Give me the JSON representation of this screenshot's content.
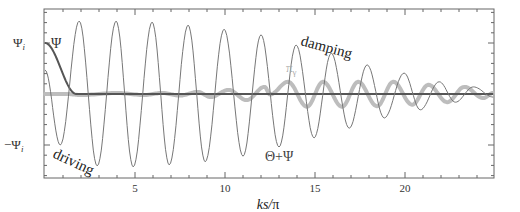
{
  "chart_data": {
    "type": "line",
    "title": "",
    "xlabel": "ks/π",
    "ylabel": "",
    "xlim": [
      0,
      24.9
    ],
    "ylim": [
      -1.65,
      1.65
    ],
    "y_unit": "Ψ_i",
    "x_ticks": [
      5,
      10,
      15,
      20
    ],
    "x_tick_labels": [
      "5",
      "10",
      "15",
      "20"
    ],
    "y_ticks": [
      1,
      -1
    ],
    "y_tick_labels": [
      "Ψ_i",
      "−Ψ_i"
    ],
    "grid": false,
    "legend": "none (inline annotations)",
    "series": [
      {
        "name": "Θ+Ψ",
        "style": "thin",
        "color": "#777777",
        "extrema": [
          [
            0,
            0.47
          ],
          [
            0.85,
            -1.0
          ],
          [
            1.9,
            1.43
          ],
          [
            2.9,
            -1.41
          ],
          [
            3.95,
            1.43
          ],
          [
            4.9,
            -1.43
          ],
          [
            5.95,
            1.41
          ],
          [
            6.9,
            -1.39
          ],
          [
            7.95,
            1.35
          ],
          [
            8.9,
            -1.33
          ],
          [
            9.95,
            1.27
          ],
          [
            11.0,
            -1.22
          ],
          [
            12.0,
            1.16
          ],
          [
            13.0,
            -1.04
          ],
          [
            13.95,
            0.96
          ],
          [
            14.95,
            -0.86
          ],
          [
            15.9,
            0.8
          ],
          [
            16.9,
            -0.67
          ],
          [
            17.9,
            0.57
          ],
          [
            18.85,
            -0.47
          ],
          [
            19.95,
            0.41
          ],
          [
            20.85,
            -0.31
          ],
          [
            21.9,
            0.24
          ],
          [
            22.8,
            -0.16
          ],
          [
            23.8,
            0.14
          ],
          [
            24.9,
            -0.06
          ]
        ]
      },
      {
        "name": "π_γ",
        "style": "thick",
        "color": "#bdbdbd",
        "extrema": [
          [
            0,
            0.0
          ],
          [
            1.2,
            0.0
          ],
          [
            2.0,
            -0.02
          ],
          [
            4.0,
            0.02
          ],
          [
            5.5,
            -0.02
          ],
          [
            6.5,
            0.02
          ],
          [
            7.5,
            -0.03
          ],
          [
            8.5,
            0.04
          ],
          [
            9.2,
            -0.06
          ],
          [
            10.2,
            0.08
          ],
          [
            11.2,
            -0.12
          ],
          [
            12.2,
            0.14
          ],
          [
            12.5,
            -0.01
          ],
          [
            13.5,
            0.24
          ],
          [
            14.55,
            -0.25
          ],
          [
            15.45,
            0.24
          ],
          [
            16.5,
            -0.25
          ],
          [
            17.4,
            0.24
          ],
          [
            18.45,
            -0.24
          ],
          [
            19.35,
            0.24
          ],
          [
            20.4,
            -0.21
          ],
          [
            21.3,
            0.18
          ],
          [
            22.35,
            -0.16
          ],
          [
            23.3,
            0.14
          ],
          [
            24.35,
            -0.08
          ],
          [
            24.9,
            0.02
          ]
        ]
      },
      {
        "name": "Ψ",
        "style": "medium",
        "color": "#555555",
        "points": [
          [
            0,
            1.0
          ],
          [
            0.3,
            0.95
          ],
          [
            0.6,
            0.75
          ],
          [
            0.9,
            0.45
          ],
          [
            1.2,
            0.2
          ],
          [
            1.5,
            0.05
          ],
          [
            1.8,
            0.0
          ],
          [
            24.9,
            0.0
          ]
        ]
      }
    ],
    "annotations": [
      {
        "text": "Ψ",
        "x": 0.45,
        "y": 1.0,
        "color": "#333333"
      },
      {
        "text": "driving",
        "x": 0.3,
        "y": -1.05,
        "rotate": 25,
        "color": "#222222"
      },
      {
        "text": "damping",
        "x": 14.2,
        "y": 1.0,
        "rotate": 15,
        "color": "#222222"
      },
      {
        "text": "π_γ",
        "x": 13.5,
        "y": 0.55,
        "color": "#aaaaaa"
      },
      {
        "text": "Θ+Ψ",
        "x": 12.3,
        "y": -1.3,
        "color": "#444444"
      }
    ]
  },
  "labels": {
    "xlabel_main": "ks/",
    "xlabel_pi": "π",
    "ytick_pos": "Ψ",
    "ytick_neg": "−Ψ",
    "ytick_sub": "i",
    "ann_psi": "Ψ",
    "ann_driving": "driving",
    "ann_damping": "damping",
    "ann_pi": "π",
    "ann_pi_sub": "γ",
    "ann_theta_psi": "Θ+Ψ",
    "xt5": "5",
    "xt10": "10",
    "xt15": "15",
    "xt20": "20"
  }
}
